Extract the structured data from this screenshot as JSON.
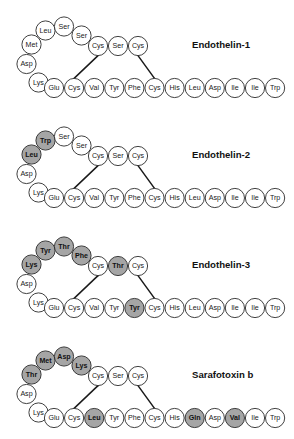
{
  "figure": {
    "type": "peptide-sequence-diagram",
    "background": "#ffffff",
    "highlight_color": "#a5a5a5",
    "plain_color": "#ffffff",
    "outline_color": "#2b2b2b",
    "bond_color": "#1a1a1a",
    "circle_radius": 9.6,
    "bottom_row_start_x": 54,
    "bottom_row_spacing": 20.1,
    "top_row_positions_x": [
      98,
      118,
      138
    ],
    "arc_positions": [
      {
        "slot": "a1",
        "x": 31.5,
        "y": 44.5
      },
      {
        "slot": "a2",
        "x": 45.5,
        "y": 30.5
      },
      {
        "slot": "a3",
        "x": 64.0,
        "y": 26.5
      },
      {
        "slot": "a4",
        "x": 81.5,
        "y": 35.5
      },
      {
        "slot": "asp",
        "x": 26.5,
        "y": 64.0
      },
      {
        "slot": "lys",
        "x": 38.5,
        "y": 82.5
      }
    ],
    "disulfide_bonds": [
      {
        "from": "top_cys_1",
        "to": "bottom_cys_1"
      },
      {
        "from": "top_cys_2",
        "to": "bottom_cys_2"
      }
    ]
  },
  "panels": [
    {
      "title": "Endothelin-1",
      "title_x": 192,
      "title_y": 48,
      "offset_y": 0,
      "arc": [
        {
          "label": "Met",
          "highlight": false
        },
        {
          "label": "Leu",
          "highlight": false
        },
        {
          "label": "Ser",
          "highlight": false
        },
        {
          "label": "Ser",
          "highlight": false
        }
      ],
      "arc_fixed": [
        {
          "label": "Asp",
          "highlight": false
        },
        {
          "label": "Lys",
          "highlight": false
        }
      ],
      "top_row": [
        {
          "label": "Cys",
          "highlight": false
        },
        {
          "label": "Ser",
          "highlight": false
        },
        {
          "label": "Cys",
          "highlight": false
        }
      ],
      "bottom_row": [
        {
          "label": "Glu",
          "highlight": false
        },
        {
          "label": "Cys",
          "highlight": false
        },
        {
          "label": "Val",
          "highlight": false
        },
        {
          "label": "Tyr",
          "highlight": false
        },
        {
          "label": "Phe",
          "highlight": false
        },
        {
          "label": "Cys",
          "highlight": false
        },
        {
          "label": "His",
          "highlight": false
        },
        {
          "label": "Leu",
          "highlight": false
        },
        {
          "label": "Asp",
          "highlight": false
        },
        {
          "label": "Ile",
          "highlight": false
        },
        {
          "label": "Ile",
          "highlight": false
        },
        {
          "label": "Trp",
          "highlight": false
        }
      ]
    },
    {
      "title": "Endothelin-2",
      "title_x": 192,
      "title_y": 48,
      "offset_y": 110,
      "arc": [
        {
          "label": "Leu",
          "highlight": true
        },
        {
          "label": "Trp",
          "highlight": true
        },
        {
          "label": "Ser",
          "highlight": false
        },
        {
          "label": "Ser",
          "highlight": false
        }
      ],
      "arc_fixed": [
        {
          "label": "Asp",
          "highlight": false
        },
        {
          "label": "Lys",
          "highlight": false
        }
      ],
      "top_row": [
        {
          "label": "Cys",
          "highlight": false
        },
        {
          "label": "Ser",
          "highlight": false
        },
        {
          "label": "Cys",
          "highlight": false
        }
      ],
      "bottom_row": [
        {
          "label": "Glu",
          "highlight": false
        },
        {
          "label": "Cys",
          "highlight": false
        },
        {
          "label": "Val",
          "highlight": false
        },
        {
          "label": "Tyr",
          "highlight": false
        },
        {
          "label": "Phe",
          "highlight": false
        },
        {
          "label": "Cys",
          "highlight": false
        },
        {
          "label": "His",
          "highlight": false
        },
        {
          "label": "Leu",
          "highlight": false
        },
        {
          "label": "Asp",
          "highlight": false
        },
        {
          "label": "Ile",
          "highlight": false
        },
        {
          "label": "Ile",
          "highlight": false
        },
        {
          "label": "Trp",
          "highlight": false
        }
      ]
    },
    {
      "title": "Endothelin-3",
      "title_x": 192,
      "title_y": 48,
      "offset_y": 220,
      "arc": [
        {
          "label": "Lys",
          "highlight": true
        },
        {
          "label": "Tyr",
          "highlight": true
        },
        {
          "label": "Thr",
          "highlight": true
        },
        {
          "label": "Phe",
          "highlight": true
        }
      ],
      "arc_fixed": [
        {
          "label": "Asp",
          "highlight": false
        },
        {
          "label": "Lys",
          "highlight": false
        }
      ],
      "top_row": [
        {
          "label": "Cys",
          "highlight": false
        },
        {
          "label": "Thr",
          "highlight": true
        },
        {
          "label": "Cys",
          "highlight": false
        }
      ],
      "bottom_row": [
        {
          "label": "Glu",
          "highlight": false
        },
        {
          "label": "Cys",
          "highlight": false
        },
        {
          "label": "Val",
          "highlight": false
        },
        {
          "label": "Tyr",
          "highlight": false
        },
        {
          "label": "Tyr",
          "highlight": true
        },
        {
          "label": "Cys",
          "highlight": false
        },
        {
          "label": "His",
          "highlight": false
        },
        {
          "label": "Leu",
          "highlight": false
        },
        {
          "label": "Asp",
          "highlight": false
        },
        {
          "label": "Ile",
          "highlight": false
        },
        {
          "label": "Ile",
          "highlight": false
        },
        {
          "label": "Trp",
          "highlight": false
        }
      ]
    },
    {
      "title": "Sarafotoxin b",
      "title_x": 192,
      "title_y": 48,
      "offset_y": 330,
      "arc": [
        {
          "label": "Thr",
          "highlight": true
        },
        {
          "label": "Met",
          "highlight": true
        },
        {
          "label": "Asp",
          "highlight": true
        },
        {
          "label": "Lys",
          "highlight": true
        }
      ],
      "arc_fixed": [
        {
          "label": "Asp",
          "highlight": false
        },
        {
          "label": "Lys",
          "highlight": false
        }
      ],
      "top_row": [
        {
          "label": "Cys",
          "highlight": false
        },
        {
          "label": "Ser",
          "highlight": false
        },
        {
          "label": "Cys",
          "highlight": false
        }
      ],
      "bottom_row": [
        {
          "label": "Glu",
          "highlight": false
        },
        {
          "label": "Cys",
          "highlight": false
        },
        {
          "label": "Leu",
          "highlight": true
        },
        {
          "label": "Tyr",
          "highlight": false
        },
        {
          "label": "Phe",
          "highlight": false
        },
        {
          "label": "Cys",
          "highlight": false
        },
        {
          "label": "His",
          "highlight": false
        },
        {
          "label": "Gln",
          "highlight": true
        },
        {
          "label": "Asp",
          "highlight": false
        },
        {
          "label": "Val",
          "highlight": true
        },
        {
          "label": "Ile",
          "highlight": false
        },
        {
          "label": "Trp",
          "highlight": false
        }
      ]
    }
  ]
}
